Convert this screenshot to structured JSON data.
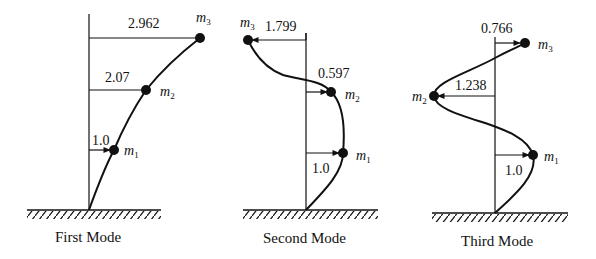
{
  "figure": {
    "type": "mode-shapes",
    "modes": [
      {
        "caption": "First Mode",
        "masses": [
          {
            "label": "m",
            "sub": "1",
            "value": "1.0"
          },
          {
            "label": "m",
            "sub": "2",
            "value": "2.07"
          },
          {
            "label": "m",
            "sub": "3",
            "value": "2.962"
          }
        ]
      },
      {
        "caption": "Second Mode",
        "masses": [
          {
            "label": "m",
            "sub": "1",
            "value": "1.0"
          },
          {
            "label": "m",
            "sub": "2",
            "value": "0.597"
          },
          {
            "label": "m",
            "sub": "3",
            "value": "1.799"
          }
        ]
      },
      {
        "caption": "Third Mode",
        "masses": [
          {
            "label": "m",
            "sub": "1",
            "value": "1.0"
          },
          {
            "label": "m",
            "sub": "2",
            "value": "1.238"
          },
          {
            "label": "m",
            "sub": "3",
            "value": "0.766"
          }
        ]
      }
    ],
    "colors": {
      "ink": "#111111",
      "background": "#ffffff"
    }
  }
}
